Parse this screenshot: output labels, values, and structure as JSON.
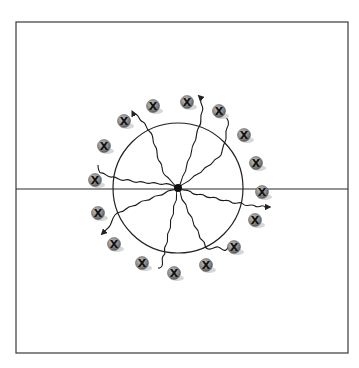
{
  "diagram": {
    "type": "scientific-illustration",
    "frame": {
      "x": 16,
      "y": 22,
      "width": 332,
      "height": 331,
      "stroke": "#3a3a3a"
    },
    "horizontal_line": {
      "y": 189,
      "x1": 16,
      "x2": 348,
      "stroke": "#2a2a2a"
    },
    "circle": {
      "cx": 178,
      "cy": 188,
      "r": 65,
      "stroke": "#222222"
    },
    "center_source": {
      "cx": 178,
      "cy": 188,
      "r": 4,
      "fill": "#111111"
    },
    "particle_label": "X",
    "particle_color": "#8a8a8a",
    "particles": [
      {
        "cx": 153,
        "cy": 106
      },
      {
        "cx": 187,
        "cy": 102
      },
      {
        "cx": 219,
        "cy": 111
      },
      {
        "cx": 244,
        "cy": 135
      },
      {
        "cx": 256,
        "cy": 163
      },
      {
        "cx": 262,
        "cy": 192
      },
      {
        "cx": 255,
        "cy": 220
      },
      {
        "cx": 234,
        "cy": 247
      },
      {
        "cx": 206,
        "cy": 265
      },
      {
        "cx": 174,
        "cy": 273
      },
      {
        "cx": 142,
        "cy": 263
      },
      {
        "cx": 114,
        "cy": 244
      },
      {
        "cx": 98,
        "cy": 213
      },
      {
        "cx": 95,
        "cy": 180
      },
      {
        "cx": 104,
        "cy": 146
      },
      {
        "cx": 124,
        "cy": 121
      }
    ],
    "rays": [
      {
        "end": [
          133,
          113
        ],
        "arrow": true
      },
      {
        "end": [
          200,
          97
        ],
        "arrow": true
      },
      {
        "end": [
          226,
          117
        ],
        "arrow": false
      },
      {
        "end": [
          268,
          207
        ],
        "arrow": true
      },
      {
        "end": [
          230,
          245
        ],
        "arrow": false
      },
      {
        "end": [
          158,
          268
        ],
        "arrow": false
      },
      {
        "end": [
          103,
          233
        ],
        "arrow": true
      },
      {
        "end": [
          98,
          165
        ],
        "arrow": false
      }
    ]
  }
}
